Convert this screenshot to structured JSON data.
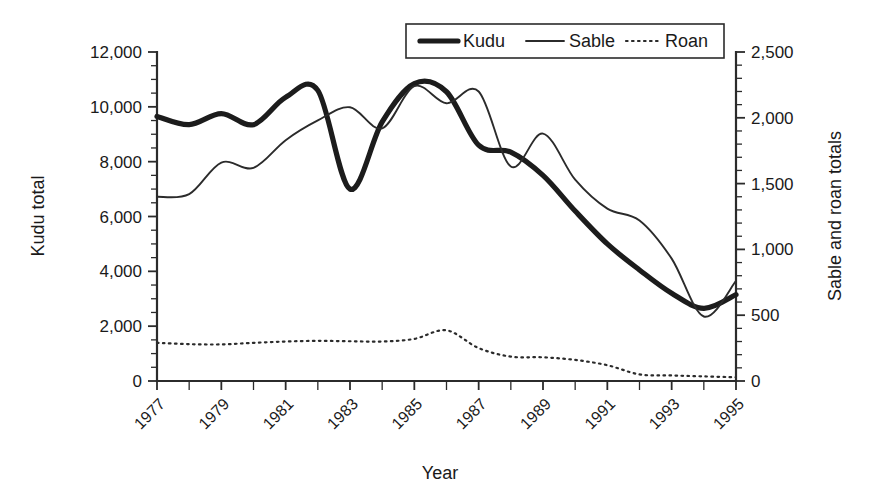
{
  "chart_data": {
    "type": "line",
    "title": "",
    "xlabel": "Year",
    "ylabel": "Kudu total",
    "y2label": "Sable and roan totals",
    "grid": false,
    "legend_position": "top-center",
    "xlim": [
      1977,
      1995
    ],
    "ylim": [
      0,
      12000
    ],
    "y2lim": [
      0,
      2500
    ],
    "xticks": [
      1977,
      1979,
      1981,
      1983,
      1985,
      1987,
      1989,
      1991,
      1993,
      1995
    ],
    "xtick_labels": [
      "1977",
      "1979",
      "1981",
      "1983",
      "1985",
      "1987",
      "1989",
      "1991",
      "1993",
      "1995"
    ],
    "xticks_minor": [
      1978,
      1980,
      1982,
      1984,
      1986,
      1988,
      1990,
      1992,
      1994
    ],
    "yticks": [
      0,
      2000,
      4000,
      6000,
      8000,
      10000,
      12000
    ],
    "ytick_labels": [
      "0",
      "2,000",
      "4,000",
      "6,000",
      "8,000",
      "10,000",
      "12,000"
    ],
    "yticks_minor": [
      500,
      1000,
      1500,
      2500,
      3000,
      3500,
      4500,
      5000,
      5500,
      6500,
      7000,
      7500,
      8500,
      9000,
      9500,
      10500,
      11000,
      11500
    ],
    "y2ticks": [
      0,
      500,
      1000,
      1500,
      2000,
      2500
    ],
    "y2tick_labels": [
      "0",
      "500",
      "1,000",
      "1,500",
      "2,000",
      "2,500"
    ],
    "y2ticks_minor": [
      100,
      200,
      300,
      400,
      600,
      700,
      800,
      900,
      1100,
      1200,
      1300,
      1400,
      1600,
      1700,
      1800,
      1900,
      2100,
      2200,
      2300,
      2400
    ],
    "x": [
      1977,
      1978,
      1979,
      1980,
      1981,
      1982,
      1983,
      1984,
      1985,
      1986,
      1987,
      1988,
      1989,
      1990,
      1991,
      1992,
      1993,
      1994,
      1995
    ],
    "series": [
      {
        "name": "Kudu",
        "axis": "left",
        "style": "thick-solid",
        "color": "#1c1c1c",
        "values": [
          9650,
          9350,
          9750,
          9350,
          10350,
          10600,
          7000,
          9450,
          10850,
          10550,
          8600,
          8350,
          7500,
          6200,
          5000,
          4050,
          3200,
          2650,
          3150
        ]
      },
      {
        "name": "Sable",
        "axis": "right",
        "style": "thin-solid",
        "color": "#2b2b2b",
        "values": [
          1400,
          1420,
          1660,
          1620,
          1830,
          1980,
          2080,
          1920,
          2240,
          2110,
          2200,
          1630,
          1880,
          1530,
          1310,
          1220,
          930,
          490,
          760
        ]
      },
      {
        "name": "Roan",
        "axis": "right",
        "style": "dotted",
        "color": "#2b2b2b",
        "values": [
          290,
          280,
          278,
          290,
          300,
          305,
          302,
          300,
          320,
          385,
          250,
          185,
          180,
          160,
          120,
          50,
          42,
          35,
          28
        ]
      }
    ],
    "legend": [
      {
        "label": "Kudu",
        "style": "thick-solid"
      },
      {
        "label": "Sable",
        "style": "thin-solid"
      },
      {
        "label": "Roan",
        "style": "dotted"
      }
    ]
  }
}
